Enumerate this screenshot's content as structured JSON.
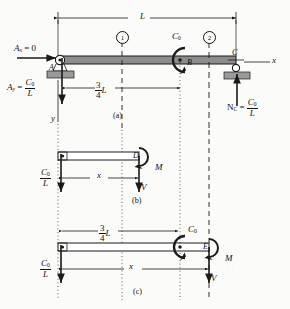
{
  "figure": {
    "type": "engineering-beam-free-body-diagram",
    "panels": [
      {
        "id": "a",
        "caption": "(a)"
      },
      {
        "id": "b",
        "caption": "(b)"
      },
      {
        "id": "c",
        "caption": "(c)"
      }
    ]
  },
  "panel_a": {
    "caption": "(a)",
    "overall_dim": "L",
    "partial_dim_num": "3",
    "partial_dim_den": "4",
    "partial_dim_unit": "L",
    "section_marker_1": "1",
    "section_marker_2": "2",
    "support_a_label": "A",
    "point_b_label": "B",
    "point_c_label": "C",
    "couple_label": "C",
    "couple_sub": "0",
    "reaction_ax": "A",
    "reaction_ax_sub": "x",
    "reaction_ax_eq": " = 0",
    "reaction_ay": "A",
    "reaction_ay_sub": "y",
    "reaction_ay_eq": " = ",
    "reaction_ay_num": "C",
    "reaction_ay_num_sub": "0",
    "reaction_ay_den": "L",
    "reaction_nc": "N",
    "reaction_nc_sub": "C",
    "reaction_nc_eq": " = ",
    "reaction_nc_num": "C",
    "reaction_nc_num_sub": "0",
    "reaction_nc_den": "L",
    "axis_x": "x",
    "axis_y": "y"
  },
  "panel_b": {
    "caption": "(b)",
    "distance_label": "x",
    "cut_point_label": "D",
    "moment_label": "M",
    "shear_label": "V",
    "reaction_num": "C",
    "reaction_num_sub": "0",
    "reaction_den": "L"
  },
  "panel_c": {
    "caption": "(c)",
    "distance_label": "x",
    "partial_dim_num": "3",
    "partial_dim_den": "4",
    "partial_dim_unit": "L",
    "cut_point_label": "E",
    "couple_label": "C",
    "couple_sub": "0",
    "moment_label": "M",
    "shear_label": "V",
    "reaction_num": "C",
    "reaction_num_sub": "0",
    "reaction_den": "L"
  },
  "colors": {
    "beam_fill": "#8c8c8c",
    "beam_stroke": "#1a1a1a",
    "hatch_fill": "#9a9a9a",
    "line": "#1a1a1a",
    "background": "#fbfbf9"
  }
}
